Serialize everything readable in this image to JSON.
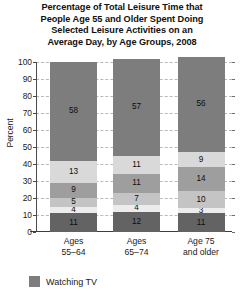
{
  "chart_data": {
    "type": "bar",
    "subtype": "stacked-column",
    "title": "Percentage of Total Leisure Time that People Age 55 and Older Spent Doing Selected Leisure Activities on an Average Day, by Age Groups, 2008",
    "title_lines": [
      "Percentage of Total Leisure Time that",
      "People Age 55 and Older Spent Doing",
      "Selected Leisure Activities on an",
      "Average Day, by Age Groups, 2008"
    ],
    "xlabel": "",
    "ylabel": "Percent",
    "ylim": [
      0,
      100
    ],
    "ytick_step": 10,
    "yticks": [
      0,
      10,
      20,
      30,
      40,
      50,
      60,
      70,
      80,
      90,
      100
    ],
    "ytick_labels": [
      "0",
      "10",
      "20",
      "30",
      "40",
      "50",
      "60",
      "70",
      "80",
      "90",
      "100"
    ],
    "grid": true,
    "grid_axis": "y",
    "grid_style": "dashed",
    "legend_position": "bottom-left",
    "categories": [
      "Ages 55–64",
      "Ages 65–74",
      "Age 75 and older"
    ],
    "category_label_lines": [
      [
        "Ages",
        "55–64"
      ],
      [
        "Ages",
        "65–74"
      ],
      [
        "Age 75",
        "and older"
      ]
    ],
    "series": [
      {
        "name": "Watching TV",
        "values": [
          58,
          57,
          56
        ],
        "color": "#7d7d7d",
        "legend": true,
        "stack_order": 6
      },
      {
        "name": "series-5",
        "values": [
          13,
          11,
          9
        ],
        "color": "#d9d9d9",
        "legend": false,
        "stack_order": 5
      },
      {
        "name": "series-4",
        "values": [
          9,
          11,
          14
        ],
        "color": "#9e9e9e",
        "legend": false,
        "stack_order": 4
      },
      {
        "name": "series-3",
        "values": [
          5,
          7,
          10
        ],
        "color": "#c4c4c4",
        "legend": false,
        "stack_order": 3
      },
      {
        "name": "series-2",
        "values": [
          4,
          4,
          3
        ],
        "color": "#ececec",
        "legend": false,
        "stack_order": 2
      },
      {
        "name": "series-1",
        "values": [
          11,
          12,
          11
        ],
        "color": "#636363",
        "legend": false,
        "stack_order": 1
      }
    ],
    "stack_bottom_to_top": {
      "Ages 55–64": [
        11,
        4,
        5,
        9,
        13,
        58
      ],
      "Ages 65–74": [
        12,
        4,
        7,
        11,
        11,
        57
      ],
      "Age 75 and older": [
        11,
        3,
        10,
        14,
        9,
        56
      ]
    },
    "segment_colors_bottom_to_top": [
      "#636363",
      "#ececec",
      "#c4c4c4",
      "#9e9e9e",
      "#d9d9d9",
      "#7d7d7d"
    ]
  },
  "legend": {
    "entries": [
      {
        "label": "Watching TV",
        "color": "#7d7d7d"
      }
    ]
  }
}
